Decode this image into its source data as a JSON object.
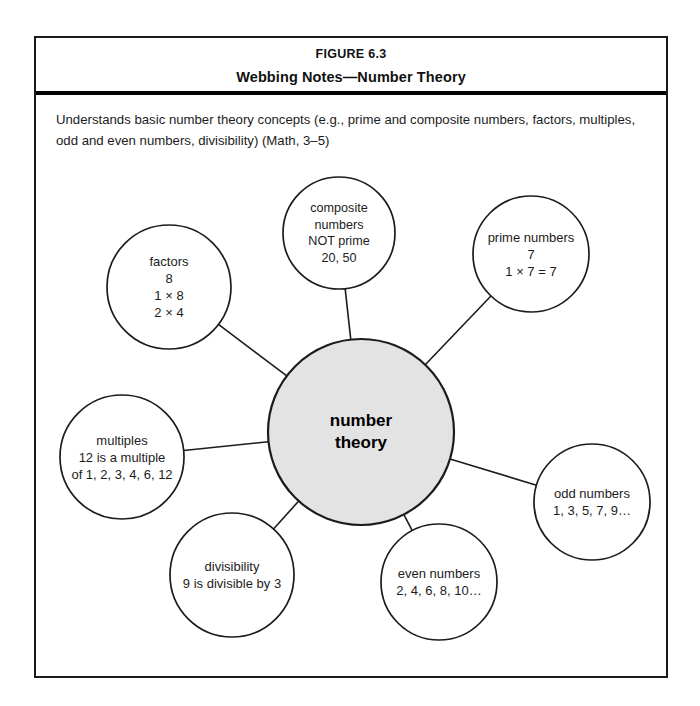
{
  "figure": {
    "number_label": "FIGURE 6.3",
    "title": "Webbing Notes—Number Theory",
    "description": "Understands basic number theory concepts (e.g., prime and composite numbers, factors, multiples, odd and even numbers, divisibility) (Math, 3–5)"
  },
  "colors": {
    "frame_border": "#1a1a1a",
    "rule": "#000000",
    "center_fill": "#e3e3e3",
    "node_stroke": "#1c1c1c",
    "text": "#1c1c1c"
  },
  "chart_data": {
    "type": "diagram",
    "diagram_kind": "concept-web",
    "title": "Webbing Notes—Number Theory",
    "center": {
      "id": "center",
      "label": "number\ntheory",
      "cx": 359,
      "cy": 430,
      "r": 93,
      "fill": "#e3e3e3"
    },
    "nodes": [
      {
        "id": "factors",
        "label": "factors\n8\n1 × 8\n2 × 4",
        "cx": 167,
        "cy": 285,
        "r": 62
      },
      {
        "id": "composite-numbers",
        "label": "composite\nnumbers\nNOT prime\n20, 50",
        "cx": 337,
        "cy": 231,
        "r": 56
      },
      {
        "id": "prime-numbers",
        "label": "prime numbers\n7\n1 × 7 = 7",
        "cx": 529,
        "cy": 252,
        "r": 58
      },
      {
        "id": "odd-numbers",
        "label": "odd numbers\n1, 3, 5, 7, 9…",
        "cx": 590,
        "cy": 500,
        "r": 58
      },
      {
        "id": "even-numbers",
        "label": "even numbers\n2, 4, 6, 8, 10…",
        "cx": 437,
        "cy": 580,
        "r": 58
      },
      {
        "id": "divisibility",
        "label": "divisibility\n9 is divisible by 3",
        "cx": 230,
        "cy": 573,
        "r": 62
      },
      {
        "id": "multiples",
        "label": "multiples\n12 is a multiple\nof 1, 2, 3, 4, 6, 12",
        "cx": 120,
        "cy": 455,
        "r": 62
      }
    ],
    "edges": [
      {
        "from": "center",
        "to": "factors"
      },
      {
        "from": "center",
        "to": "composite-numbers"
      },
      {
        "from": "center",
        "to": "prime-numbers"
      },
      {
        "from": "center",
        "to": "odd-numbers"
      },
      {
        "from": "center",
        "to": "even-numbers"
      },
      {
        "from": "center",
        "to": "divisibility"
      },
      {
        "from": "center",
        "to": "multiples"
      }
    ]
  }
}
